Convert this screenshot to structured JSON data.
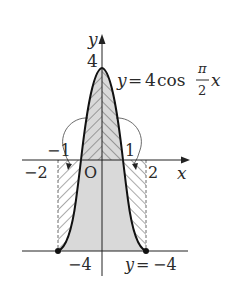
{
  "figure": {
    "type": "function-graph-area",
    "axes": {
      "x_label": "x",
      "y_label": "y",
      "origin_label": "O"
    },
    "curve": {
      "equation_lhs": "y",
      "equation_eq": "=",
      "equation_coef": "4",
      "equation_func": "cos",
      "frac_num": "π",
      "frac_den": "2",
      "equation_var": "x"
    },
    "line": {
      "label": "y = −4",
      "label_y": "y",
      "label_eq": "=",
      "label_val": "−4"
    },
    "tick_labels": {
      "y_top": "4",
      "y_bottom": "−4",
      "x_neg1": "−1",
      "x_pos1": "1",
      "x_neg2": "−2",
      "x_pos2": "2"
    },
    "colors": {
      "shade": "#d6d6d6",
      "hatch": "#555555",
      "curve": "#111111",
      "axis": "#222222"
    }
  }
}
